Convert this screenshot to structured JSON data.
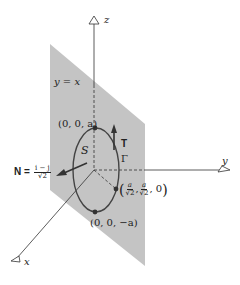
{
  "diagram": {
    "type": "3d-surface-figure",
    "colors": {
      "plane": "#c4c4c4",
      "axes": "#333333",
      "curve": "#444444",
      "background": "#ffffff"
    },
    "axes": {
      "x_label": "x",
      "y_label": "y",
      "z_label": "z"
    },
    "plane_label": "y = x",
    "surface_label": "S",
    "curve_label": "Γ",
    "tangent_label": "T",
    "normal": {
      "label": "N =",
      "numerator": "i − j",
      "denominator": "√2"
    },
    "points": {
      "top": "(0, 0, a)",
      "bottom": "(0, 0, −a)",
      "side": {
        "open": "(",
        "x_num": "a",
        "x_den": "√2",
        "sep": ",",
        "y_num": "a",
        "y_den": "√2",
        "z": ", 0",
        "close": ")"
      }
    }
  }
}
